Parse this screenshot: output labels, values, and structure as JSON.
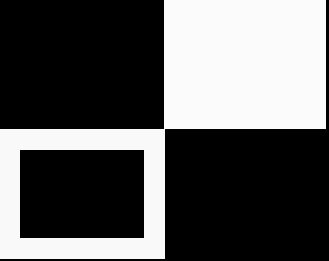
{
  "canvas": {
    "width": 329,
    "height": 261,
    "background": "#000000"
  },
  "colors": {
    "black": "#000000",
    "white": "#fbfbfb"
  },
  "blocks": [
    {
      "name": "top-left-black-quadrant",
      "x": 0,
      "y": 0,
      "w": 164,
      "h": 129,
      "color": "#000000"
    },
    {
      "name": "top-right-white-quadrant",
      "x": 164,
      "y": 0,
      "w": 162,
      "h": 129,
      "color": "#fbfbfb"
    },
    {
      "name": "bottom-left-white-frame",
      "x": 0,
      "y": 129,
      "w": 165,
      "h": 130,
      "color": "#f9f9f9"
    },
    {
      "name": "inner-black-rectangle",
      "x": 20,
      "y": 150,
      "w": 124,
      "h": 88,
      "color": "#000000"
    },
    {
      "name": "bottom-right-black-quadrant",
      "x": 165,
      "y": 129,
      "w": 164,
      "h": 132,
      "color": "#000000"
    }
  ]
}
